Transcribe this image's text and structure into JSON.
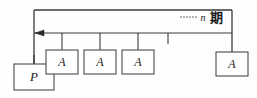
{
  "diagram": {
    "colors": {
      "line": "#3a3a3a",
      "box_fill": "#ffffff",
      "box_stroke": "#4a4a4a",
      "text": "#1a1a1a",
      "background": "#fefefe"
    },
    "present_value_box": {
      "label": "P"
    },
    "annuity_boxes": [
      {
        "label": "A"
      },
      {
        "label": "A"
      },
      {
        "label": "A"
      },
      {
        "label": "A"
      }
    ],
    "period_annotation": {
      "ellipsis": "......",
      "variable": "n",
      "unit": "期"
    },
    "timeline": {
      "tick_count": 4,
      "arrow_direction": "left"
    }
  }
}
